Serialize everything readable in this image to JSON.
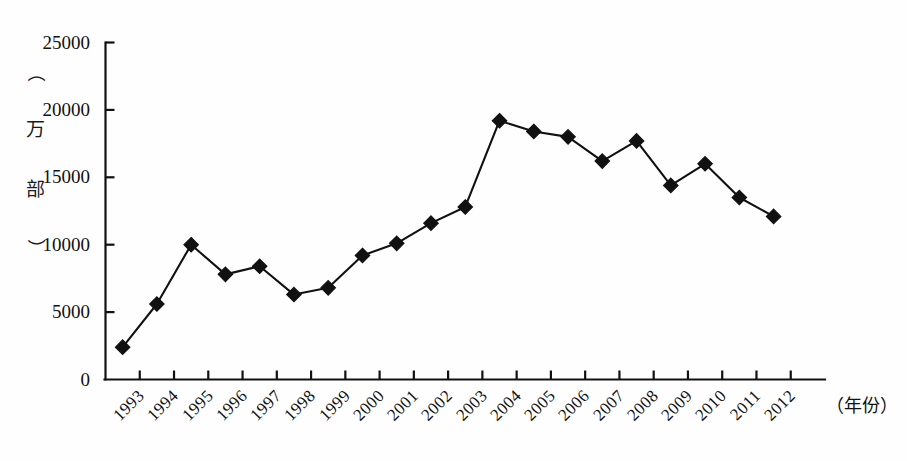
{
  "chart_data": {
    "type": "line",
    "title": "",
    "subtitle": "",
    "xlabel": "（年份）",
    "ylabel": "（万部）",
    "y_unit_chars": [
      "（",
      "万",
      "部",
      "）"
    ],
    "categories": [
      "1993",
      "1994",
      "1995",
      "1996",
      "1997",
      "1998",
      "1999",
      "2000",
      "2001",
      "2002",
      "2003",
      "2004",
      "2005",
      "2006",
      "2007",
      "2008",
      "2009",
      "2010",
      "2011",
      "2012"
    ],
    "series": [
      {
        "name": "",
        "values": [
          2400,
          5600,
          10000,
          7800,
          8400,
          6300,
          6800,
          9200,
          10100,
          11600,
          12800,
          19200,
          18400,
          18000,
          16200,
          17700,
          14400,
          16000,
          13500,
          12100
        ]
      }
    ],
    "ylim": [
      0,
      25000
    ],
    "y_ticks": [
      0,
      5000,
      10000,
      15000,
      20000,
      25000
    ],
    "y_tick_labels": [
      "0",
      "5000",
      "10000",
      "15000",
      "20000",
      "25000"
    ],
    "grid": false,
    "legend": "none",
    "marker": "diamond",
    "line_color": "#111111",
    "marker_color": "#111111",
    "axis_color": "#111111",
    "background_color": "#fefefe"
  }
}
